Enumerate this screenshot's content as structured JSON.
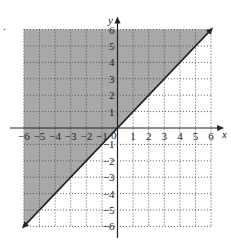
{
  "chart_data": {
    "type": "line",
    "title": "",
    "xlabel": "x",
    "ylabel": "y",
    "xlim": [
      -6,
      6
    ],
    "ylim": [
      -6,
      6
    ],
    "grid": true,
    "grid_style": "dotted",
    "x_ticks": [
      -6,
      -5,
      -4,
      -3,
      -2,
      -1,
      1,
      2,
      3,
      4,
      5,
      6
    ],
    "y_ticks": [
      -6,
      -5,
      -4,
      -3,
      -2,
      -1,
      1,
      2,
      3,
      4,
      5,
      6
    ],
    "origin_label": "0",
    "series": [
      {
        "name": "y = x",
        "type": "boundary-line",
        "style": "solid",
        "arrows": "both",
        "points": [
          [
            -6,
            -6
          ],
          [
            6,
            6
          ]
        ]
      }
    ],
    "shaded_region": {
      "description": "region above the line y = x (y >= x)",
      "polygon": [
        [
          -6,
          -6
        ],
        [
          -6,
          6
        ],
        [
          6,
          6
        ]
      ]
    }
  },
  "colors": {
    "shade": "#a8a8a8",
    "grid": "#555555",
    "axis": "#222222",
    "line": "#222222",
    "background": "#ffffff"
  },
  "labels": {
    "x_axis": "x",
    "y_axis": "y",
    "origin": "0",
    "corner_marker": "."
  }
}
